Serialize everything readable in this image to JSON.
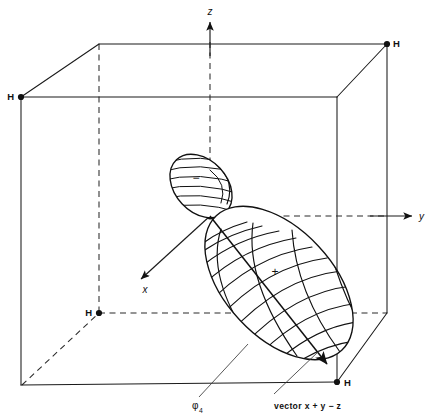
{
  "figure": {
    "type": "molecular-orbital-diagram",
    "background_color": "#ffffff",
    "line_color": "#111111"
  },
  "axes": {
    "z": {
      "label": "z",
      "direction": "up",
      "arrow": true
    },
    "y": {
      "label": "y",
      "direction": "right",
      "arrow": true
    },
    "x": {
      "label": "x",
      "direction": "down-left",
      "arrow": true
    }
  },
  "atoms": [
    {
      "label": "H",
      "position": "back-top-right"
    },
    {
      "label": "H",
      "position": "front-top-left"
    },
    {
      "label": "H",
      "position": "back-bottom-left"
    },
    {
      "label": "H",
      "position": "front-bottom-right"
    }
  ],
  "orbital": {
    "positive_lobe_sign": "+",
    "negative_lobe_sign": "−",
    "name": "φ",
    "name_subscript": "4"
  },
  "annotations": {
    "orbital_label": "φ",
    "orbital_label_subscript": "4",
    "vector_label": "vector  x + y − z"
  }
}
